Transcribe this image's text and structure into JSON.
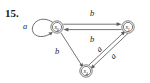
{
  "figure": {
    "problem_number": "15.",
    "caption": "",
    "type": "finite-state-machine-diagram"
  },
  "diagram": {
    "states": [
      {
        "id": "s0",
        "label": "s",
        "subscript": "0",
        "accepting": true,
        "cx": 57,
        "cy": 27,
        "r": 6.2
      },
      {
        "id": "s1",
        "label": "s",
        "subscript": "1",
        "accepting": true,
        "cx": 128,
        "cy": 27,
        "r": 6.2
      },
      {
        "id": "s4",
        "label": "s",
        "subscript": "4",
        "accepting": true,
        "cx": 86,
        "cy": 71,
        "r": 6.2
      }
    ],
    "transitions": [
      {
        "from": "s0",
        "to": "s0",
        "label": "a",
        "kind": "self-loop",
        "label_x": 25,
        "label_y": 29
      },
      {
        "from": "s0",
        "to": "s1",
        "label": "b",
        "kind": "straight-top",
        "label_x": 92,
        "label_y": 16
      },
      {
        "from": "s1",
        "to": "s0",
        "label": "b",
        "kind": "straight-return",
        "label_x": 92,
        "label_y": 42
      },
      {
        "from": "s0",
        "to": "s4",
        "label": "b",
        "kind": "diagonal-left",
        "label_x": 57,
        "label_y": 54
      },
      {
        "from": "s4",
        "to": "s1",
        "label": "a",
        "kind": "diagonal-right-inner",
        "label_x": 101,
        "label_y": 51
      },
      {
        "from": "s1",
        "to": "s4",
        "label": "a",
        "kind": "diagonal-right-outer",
        "label_x": 115,
        "label_y": 56
      }
    ],
    "colors": {
      "stroke": "#5c5c5c",
      "text": "#26251f",
      "number": "#1a1a1a",
      "background": "#ffffff"
    }
  }
}
